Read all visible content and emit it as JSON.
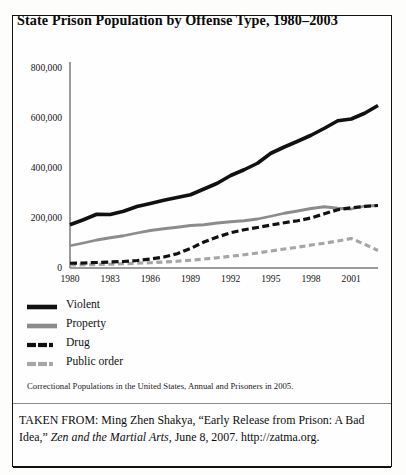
{
  "figure": {
    "title": "State Prison Population by Offense Type, 1980–2003",
    "source_note": "Correctional Populations in the United States, Annual and Prisoners in 2005.",
    "credit_prefix": "TAKEN FROM: Ming Zhen Shakya, “Early Release from Prison: A Bad Idea,” ",
    "credit_italic": "Zen and the Martial Arts",
    "credit_suffix": ", June 8, 2007. http://zatma.org."
  },
  "colors": {
    "violent": "#111111",
    "property": "#8c8c8c",
    "drug": "#111111",
    "public_order": "#a6a6a6",
    "axis": "#7a7a7a",
    "border": "#111111"
  },
  "legend": {
    "items": [
      {
        "label": "Violent",
        "style": "solid",
        "color": "#111111"
      },
      {
        "label": "Property",
        "style": "solid",
        "color": "#8c8c8c"
      },
      {
        "label": "Drug",
        "style": "dashed",
        "color": "#111111"
      },
      {
        "label": "Public order",
        "style": "dashed",
        "color": "#a6a6a6"
      }
    ]
  },
  "chart_data": {
    "type": "line",
    "title": "State Prison Population by Offense Type, 1980–2003",
    "xlabel": "",
    "ylabel": "",
    "xlim": [
      1980,
      2003
    ],
    "ylim": [
      0,
      800000
    ],
    "ytick_labels": [
      "0",
      "200,000",
      "400,000",
      "600,000",
      "800,000"
    ],
    "yticks": [
      0,
      200000,
      400000,
      600000,
      800000
    ],
    "xtick_labels": [
      "1980",
      "1983",
      "1986",
      "1989",
      "1992",
      "1995",
      "1998",
      "2001"
    ],
    "xticks": [
      1980,
      1983,
      1986,
      1989,
      1992,
      1995,
      1998,
      2001
    ],
    "grid": false,
    "legend_position": "below-plot-left",
    "x": [
      1980,
      1981,
      1982,
      1983,
      1984,
      1985,
      1986,
      1987,
      1988,
      1989,
      1990,
      1991,
      1992,
      1993,
      1994,
      1995,
      1996,
      1997,
      1998,
      1999,
      2000,
      2001,
      2002,
      2003
    ],
    "series": [
      {
        "name": "Violent",
        "style": "solid",
        "color": "#111111",
        "values": [
          173000,
          193000,
          215000,
          214000,
          227000,
          246000,
          258000,
          271000,
          282000,
          293000,
          316000,
          339000,
          370000,
          393000,
          419000,
          459000,
          484000,
          507000,
          531000,
          559000,
          589000,
          596000,
          619000,
          650000
        ]
      },
      {
        "name": "Property",
        "style": "solid",
        "color": "#8c8c8c",
        "values": [
          89000,
          100000,
          112000,
          121000,
          129000,
          140000,
          150000,
          157000,
          163000,
          170000,
          173000,
          180000,
          185000,
          189000,
          196000,
          207000,
          219000,
          228000,
          238000,
          245000,
          239000,
          236000,
          248000,
          250000
        ]
      },
      {
        "name": "Drug",
        "style": "dashed",
        "color": "#111111",
        "values": [
          19000,
          20000,
          22000,
          24000,
          26000,
          30000,
          36000,
          44000,
          57000,
          78000,
          104000,
          124000,
          141000,
          153000,
          162000,
          172000,
          181000,
          189000,
          200000,
          217000,
          233000,
          241000,
          246000,
          250000
        ]
      },
      {
        "name": "Public order",
        "style": "dashed",
        "color": "#a6a6a6",
        "values": [
          12000,
          13000,
          14000,
          15000,
          17000,
          19000,
          21000,
          24000,
          27000,
          31000,
          36000,
          41000,
          47000,
          53000,
          60000,
          68000,
          76000,
          83000,
          92000,
          99000,
          108000,
          118000,
          95000,
          70000
        ]
      }
    ]
  }
}
